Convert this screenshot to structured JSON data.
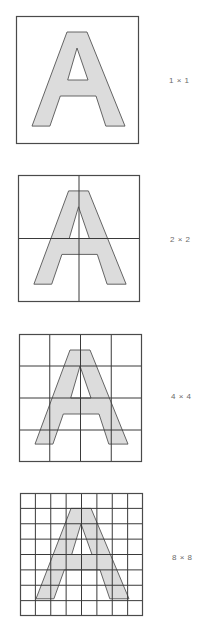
{
  "figure": {
    "glyph": "A",
    "colors": {
      "glyph_fill": "#dcdcdc",
      "glyph_stroke": "#555555",
      "grid_line": "#3a3a3a",
      "frame": "#4a4a4a",
      "label_text": "#6a6a6a",
      "background": "#ffffff"
    },
    "panels": [
      {
        "label": "1 × 1",
        "grid": 1,
        "x": 16,
        "y": 16,
        "w": 123,
        "h": 128,
        "label_x": 169,
        "label_y": 77
      },
      {
        "label": "2 × 2",
        "grid": 2,
        "x": 18,
        "y": 175,
        "w": 122,
        "h": 127,
        "label_x": 170,
        "label_y": 236
      },
      {
        "label": "4 × 4",
        "grid": 4,
        "x": 19,
        "y": 334,
        "w": 123,
        "h": 128,
        "label_x": 171,
        "label_y": 393
      },
      {
        "label": "8 × 8",
        "grid": 8,
        "x": 20,
        "y": 493,
        "w": 123,
        "h": 124,
        "label_x": 172,
        "label_y": 554
      }
    ]
  }
}
